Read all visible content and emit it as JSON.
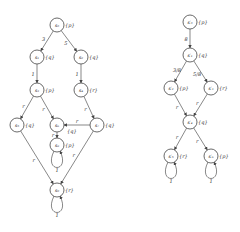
{
  "graphs": [
    {
      "name": "left-graph",
      "nodes": [
        {
          "id": "s0",
          "label": "s₀",
          "prop": "{p}"
        },
        {
          "id": "s1",
          "label": "s₁",
          "prop": "{q}"
        },
        {
          "id": "s2",
          "label": "s₂",
          "prop": "{q}"
        },
        {
          "id": "s3",
          "label": "s₃",
          "prop": "{p}"
        },
        {
          "id": "s4",
          "label": "s₄",
          "prop": "{r}"
        },
        {
          "id": "s5",
          "label": "s₅",
          "prop": "{q}"
        },
        {
          "id": "s6",
          "label": "s₆",
          "prop": ""
        },
        {
          "id": "s7",
          "label": "s₇",
          "prop": "{q}"
        },
        {
          "id": "s8",
          "label": "s₈",
          "prop": "{p}"
        },
        {
          "id": "s9",
          "label": "s₉",
          "prop": "{r}"
        }
      ],
      "edges": [
        {
          "from": "s0",
          "to": "s1",
          "label": "3"
        },
        {
          "from": "s0",
          "to": "s2",
          "label": "5"
        },
        {
          "from": "s1",
          "to": "s3",
          "label": "1"
        },
        {
          "from": "s2",
          "to": "s4",
          "label": "1"
        },
        {
          "from": "s3",
          "to": "s5",
          "label": "r"
        },
        {
          "from": "s3",
          "to": "s6",
          "label": "r"
        },
        {
          "from": "s4",
          "to": "s7",
          "label": "r"
        },
        {
          "from": "s7",
          "to": "s6",
          "label": "r"
        },
        {
          "from": "s6",
          "to": "s8",
          "label": "r"
        },
        {
          "from": "s5",
          "to": "s9",
          "label": "r"
        },
        {
          "from": "s7",
          "to": "s9",
          "label": "r"
        },
        {
          "from": "s8",
          "to": "s8",
          "label": "1"
        },
        {
          "from": "s9",
          "to": "s9",
          "label": "1"
        }
      ],
      "extra_labels": [
        {
          "near": "s6",
          "text": "{q}"
        }
      ]
    },
    {
      "name": "right-graph",
      "nodes": [
        {
          "id": "t0",
          "label": "s′₀",
          "prop": "{p}"
        },
        {
          "id": "t1",
          "label": "s′₁",
          "prop": "{q}"
        },
        {
          "id": "t2",
          "label": "s′₂",
          "prop": "{p}"
        },
        {
          "id": "t3",
          "label": "s′₃",
          "prop": "{r}"
        },
        {
          "id": "t4",
          "label": "s′₄",
          "prop": "{q}"
        },
        {
          "id": "t5",
          "label": "s′₅",
          "prop": "{r}"
        },
        {
          "id": "t6",
          "label": "s′₆",
          "prop": "{p}"
        }
      ],
      "edges": [
        {
          "from": "t0",
          "to": "t1",
          "label": "8"
        },
        {
          "from": "t1",
          "to": "t2",
          "label": "3/8"
        },
        {
          "from": "t1",
          "to": "t3",
          "label": "5/8"
        },
        {
          "from": "t2",
          "to": "t4",
          "label": "r"
        },
        {
          "from": "t3",
          "to": "t4",
          "label": "r"
        },
        {
          "from": "t4",
          "to": "t5",
          "label": "r"
        },
        {
          "from": "t4",
          "to": "t6",
          "label": "r"
        },
        {
          "from": "t5",
          "to": "t5",
          "label": "1"
        },
        {
          "from": "t6",
          "to": "t6",
          "label": "1"
        }
      ]
    }
  ]
}
